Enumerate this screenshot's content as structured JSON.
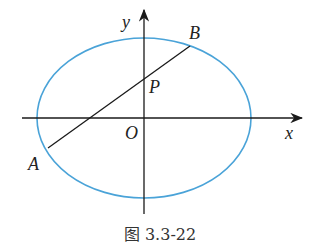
{
  "figure": {
    "caption": "图 3.3-22",
    "colors": {
      "ellipse": "#4aa3d8",
      "axes": "#1a1a1a",
      "line": "#1a1a1a"
    },
    "labels": {
      "x_axis": "x",
      "y_axis": "y",
      "origin": "O",
      "point_A": "A",
      "point_B": "B",
      "point_P": "P"
    }
  }
}
